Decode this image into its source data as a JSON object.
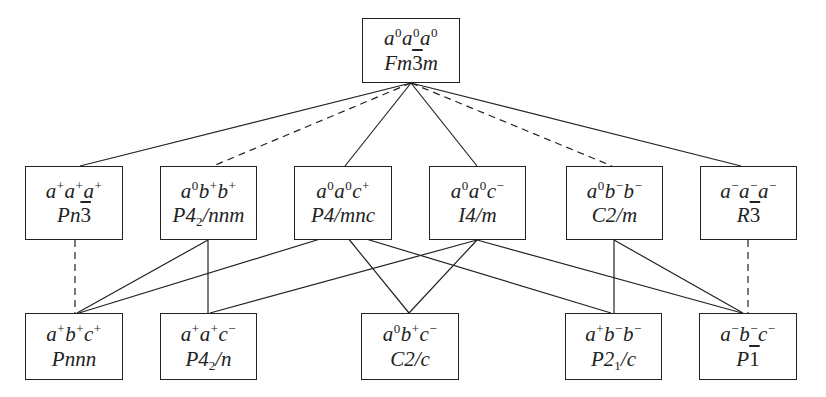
{
  "diagram": {
    "type": "group-subgroup hierarchy (octahedral tilt systems)",
    "legend": {
      "solid_line": "direct subgroup relation",
      "dashed_line": "subgroup relation (dashed)"
    },
    "nodes": [
      {
        "id": "n0",
        "row": 0,
        "tilt": [
          [
            "a",
            "0"
          ],
          [
            "a",
            "0"
          ],
          [
            "a",
            "0"
          ]
        ],
        "group": [
          {
            "t": "Fm"
          },
          {
            "t": "3",
            "bar": true
          },
          {
            "t": "m"
          }
        ],
        "tilt_text": "a0a0a0",
        "group_text": "Fm-3m",
        "box": [
          362,
          18,
          98,
          65
        ]
      },
      {
        "id": "n1",
        "row": 1,
        "tilt": [
          [
            "a",
            "+"
          ],
          [
            "a",
            "+"
          ],
          [
            "a",
            "+"
          ]
        ],
        "group": [
          {
            "t": "Pn"
          },
          {
            "t": "3",
            "bar": true
          }
        ],
        "tilt_text": "a+a+a+",
        "group_text": "Pn-3",
        "box": [
          25,
          166,
          98,
          74
        ]
      },
      {
        "id": "n2",
        "row": 1,
        "tilt": [
          [
            "a",
            "0"
          ],
          [
            "b",
            "+"
          ],
          [
            "b",
            "+"
          ]
        ],
        "group": [
          {
            "t": "P4"
          },
          {
            "t": "2",
            "sub": true
          },
          {
            "t": "/nnm"
          }
        ],
        "tilt_text": "a0b+b+",
        "group_text": "P4_2/nnm",
        "box": [
          160,
          166,
          97,
          74
        ]
      },
      {
        "id": "n3",
        "row": 1,
        "tilt": [
          [
            "a",
            "0"
          ],
          [
            "a",
            "0"
          ],
          [
            "c",
            "+"
          ]
        ],
        "group": [
          {
            "t": "P4/mnc"
          }
        ],
        "tilt_text": "a0a0c+",
        "group_text": "P4/mnc",
        "box": [
          294,
          166,
          98,
          74
        ]
      },
      {
        "id": "n4",
        "row": 1,
        "tilt": [
          [
            "a",
            "0"
          ],
          [
            "a",
            "0"
          ],
          [
            "c",
            "−"
          ]
        ],
        "group": [
          {
            "t": "I4/m"
          }
        ],
        "tilt_text": "a0a0c-",
        "group_text": "I4/m",
        "box": [
          429,
          166,
          97,
          74
        ]
      },
      {
        "id": "n5",
        "row": 1,
        "tilt": [
          [
            "a",
            "0"
          ],
          [
            "b",
            "−"
          ],
          [
            "b",
            "−"
          ]
        ],
        "group": [
          {
            "t": "C2/m"
          }
        ],
        "tilt_text": "a0b-b-",
        "group_text": "C2/m",
        "box": [
          566,
          166,
          97,
          74
        ]
      },
      {
        "id": "n6",
        "row": 1,
        "tilt": [
          [
            "a",
            "−"
          ],
          [
            "a",
            "−"
          ],
          [
            "a",
            "−"
          ]
        ],
        "group": [
          {
            "t": "R"
          },
          {
            "t": "3",
            "bar": true
          }
        ],
        "tilt_text": "a-a-a-",
        "group_text": "R-3",
        "box": [
          700,
          166,
          97,
          74
        ]
      },
      {
        "id": "n7",
        "row": 2,
        "tilt": [
          [
            "a",
            "+"
          ],
          [
            "b",
            "+"
          ],
          [
            "c",
            "+"
          ]
        ],
        "group": [
          {
            "t": "Pnnn"
          }
        ],
        "tilt_text": "a+b+c+",
        "group_text": "Pnnn",
        "box": [
          25,
          313,
          98,
          67
        ]
      },
      {
        "id": "n8",
        "row": 2,
        "tilt": [
          [
            "a",
            "+"
          ],
          [
            "a",
            "+"
          ],
          [
            "c",
            "−"
          ]
        ],
        "group": [
          {
            "t": "P4"
          },
          {
            "t": "2",
            "sub": true
          },
          {
            "t": "/n"
          }
        ],
        "tilt_text": "a+a+c-",
        "group_text": "P4_2/n",
        "box": [
          160,
          313,
          97,
          67
        ]
      },
      {
        "id": "n9",
        "row": 2,
        "tilt": [
          [
            "a",
            "0"
          ],
          [
            "b",
            "+"
          ],
          [
            "c",
            "−"
          ]
        ],
        "group": [
          {
            "t": "C2/c"
          }
        ],
        "tilt_text": "a0b+c-",
        "group_text": "C2/c",
        "box": [
          361,
          313,
          98,
          67
        ]
      },
      {
        "id": "n10",
        "row": 2,
        "tilt": [
          [
            "a",
            "+"
          ],
          [
            "b",
            "−"
          ],
          [
            "b",
            "−"
          ]
        ],
        "group": [
          {
            "t": "P2"
          },
          {
            "t": "1",
            "sub": true
          },
          {
            "t": "/c"
          }
        ],
        "tilt_text": "a+b-b-",
        "group_text": "P2_1/c",
        "box": [
          565,
          313,
          97,
          67
        ]
      },
      {
        "id": "n11",
        "row": 2,
        "tilt": [
          [
            "a",
            "−"
          ],
          [
            "b",
            "−"
          ],
          [
            "c",
            "−"
          ]
        ],
        "group": [
          {
            "t": "P"
          },
          {
            "t": "1",
            "bar": true
          }
        ],
        "tilt_text": "a-b-c-",
        "group_text": "P-1",
        "box": [
          699,
          313,
          98,
          67
        ]
      }
    ],
    "edges": [
      {
        "from": "n0",
        "to": "n1",
        "style": "solid",
        "x1": 411,
        "y1": 83,
        "x2": 80,
        "y2": 166
      },
      {
        "from": "n0",
        "to": "n2",
        "style": "dashed",
        "x1": 411,
        "y1": 83,
        "x2": 213,
        "y2": 166
      },
      {
        "from": "n0",
        "to": "n3",
        "style": "solid",
        "x1": 411,
        "y1": 83,
        "x2": 345,
        "y2": 166
      },
      {
        "from": "n0",
        "to": "n4",
        "style": "solid",
        "x1": 411,
        "y1": 83,
        "x2": 477,
        "y2": 166
      },
      {
        "from": "n0",
        "to": "n5",
        "style": "dashed",
        "x1": 411,
        "y1": 83,
        "x2": 612,
        "y2": 166
      },
      {
        "from": "n0",
        "to": "n6",
        "style": "solid",
        "x1": 411,
        "y1": 83,
        "x2": 741,
        "y2": 166
      },
      {
        "from": "n1",
        "to": "n7",
        "style": "dashed",
        "x1": 75,
        "y1": 240,
        "x2": 75,
        "y2": 313
      },
      {
        "from": "n2",
        "to": "n7",
        "style": "solid",
        "x1": 208,
        "y1": 240,
        "x2": 77,
        "y2": 313
      },
      {
        "from": "n2",
        "to": "n8",
        "style": "solid",
        "x1": 208,
        "y1": 240,
        "x2": 208,
        "y2": 313
      },
      {
        "from": "n3",
        "to": "n7",
        "style": "solid",
        "x1": 343,
        "y1": 232,
        "x2": 79,
        "y2": 313
      },
      {
        "from": "n3",
        "to": "n9",
        "style": "solid",
        "x1": 343,
        "y1": 232,
        "x2": 409,
        "y2": 313
      },
      {
        "from": "n3",
        "to": "n10",
        "style": "solid",
        "x1": 343,
        "y1": 232,
        "x2": 611,
        "y2": 313
      },
      {
        "from": "n4",
        "to": "n8",
        "style": "solid",
        "x1": 477,
        "y1": 240,
        "x2": 210,
        "y2": 313
      },
      {
        "from": "n4",
        "to": "n9",
        "style": "solid",
        "x1": 477,
        "y1": 240,
        "x2": 409,
        "y2": 313
      },
      {
        "from": "n4",
        "to": "n11",
        "style": "solid",
        "x1": 477,
        "y1": 240,
        "x2": 742,
        "y2": 313
      },
      {
        "from": "n5",
        "to": "n10",
        "style": "solid",
        "x1": 614,
        "y1": 240,
        "x2": 614,
        "y2": 313
      },
      {
        "from": "n5",
        "to": "n11",
        "style": "solid",
        "x1": 614,
        "y1": 240,
        "x2": 743,
        "y2": 313
      },
      {
        "from": "n6",
        "to": "n11",
        "style": "dashed",
        "x1": 748,
        "y1": 240,
        "x2": 748,
        "y2": 313
      }
    ],
    "colors": {
      "line": "#222222",
      "box_border": "#222222",
      "background": "#ffffff",
      "text": "#222222"
    }
  }
}
